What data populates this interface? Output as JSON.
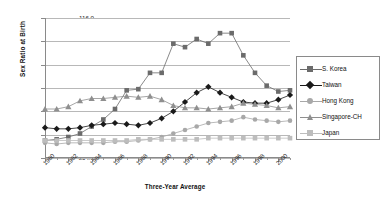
{
  "chart_data": {
    "type": "line",
    "title": "",
    "xlabel": "Three-Year Average",
    "ylabel": "Sex Ratio at Birth",
    "ylim": [
      104.0,
      116.0
    ],
    "ytick_labels": [
      "104.0",
      "106.0",
      "108.0",
      "110.0",
      "112.0",
      "114.0",
      "116.0"
    ],
    "ytick_values": [
      104.0,
      106.0,
      108.0,
      110.0,
      112.0,
      114.0,
      116.0
    ],
    "grid": "horizontal",
    "legend_position": "right",
    "xlim": [
      1980,
      2001
    ],
    "xtick_labels": [
      "1980",
      "1982",
      "1984",
      "1986",
      "1988",
      "1990",
      "1992",
      "1994",
      "1996",
      "1998",
      "2000"
    ],
    "xtick_values": [
      1980,
      1982,
      1984,
      1986,
      1988,
      1990,
      1992,
      1994,
      1996,
      1998,
      2000
    ],
    "x": [
      1980,
      1981,
      1982,
      1983,
      1984,
      1985,
      1986,
      1987,
      1988,
      1989,
      1990,
      1991,
      1992,
      1993,
      1994,
      1995,
      1996,
      1997,
      1998,
      1999,
      2000,
      2001
    ],
    "series": [
      {
        "name": "S. Korea",
        "color": "#6b6b6b",
        "marker": "square",
        "values": [
          105.5,
          105.6,
          105.8,
          106.1,
          106.7,
          107.3,
          108.2,
          109.8,
          109.9,
          111.3,
          111.3,
          113.8,
          113.5,
          114.2,
          113.8,
          114.7,
          114.7,
          112.8,
          111.3,
          110.2,
          109.7,
          109.8
        ]
      },
      {
        "name": "Taiwan",
        "color": "#1a1a1a",
        "marker": "diamond",
        "values": [
          106.6,
          106.5,
          106.5,
          106.6,
          106.8,
          106.9,
          107.0,
          106.9,
          106.8,
          107.0,
          107.4,
          108.0,
          108.8,
          109.6,
          110.1,
          109.6,
          109.2,
          108.8,
          108.7,
          108.7,
          109.0,
          109.4
        ]
      },
      {
        "name": "Hong Kong",
        "color": "#a8a8a8",
        "marker": "circle",
        "values": [
          105.3,
          105.2,
          105.3,
          105.3,
          105.3,
          105.3,
          105.4,
          105.4,
          105.5,
          105.6,
          105.8,
          106.1,
          106.4,
          106.7,
          107.0,
          107.1,
          107.2,
          107.5,
          107.3,
          107.2,
          107.1,
          107.2
        ]
      },
      {
        "name": "Singapore-CH",
        "color": "#8f8f8f",
        "marker": "triangle",
        "values": [
          108.2,
          108.2,
          108.4,
          108.9,
          109.1,
          109.1,
          109.2,
          109.3,
          109.2,
          109.3,
          109.0,
          108.5,
          108.3,
          108.3,
          108.2,
          108.3,
          108.4,
          108.7,
          108.6,
          108.5,
          108.3,
          108.4
        ]
      },
      {
        "name": "Japan",
        "color": "#bdbdbd",
        "marker": "square",
        "values": [
          105.5,
          105.5,
          105.5,
          105.5,
          105.5,
          105.5,
          105.5,
          105.5,
          105.6,
          105.6,
          105.6,
          105.6,
          105.6,
          105.6,
          105.7,
          105.7,
          105.7,
          105.7,
          105.7,
          105.7,
          105.7,
          105.7
        ]
      }
    ]
  },
  "legend": {
    "items": [
      {
        "label": "S. Korea"
      },
      {
        "label": "Taiwan"
      },
      {
        "label": "Hong Kong"
      },
      {
        "label": "Singapore-CH"
      },
      {
        "label": "Japan"
      }
    ]
  }
}
